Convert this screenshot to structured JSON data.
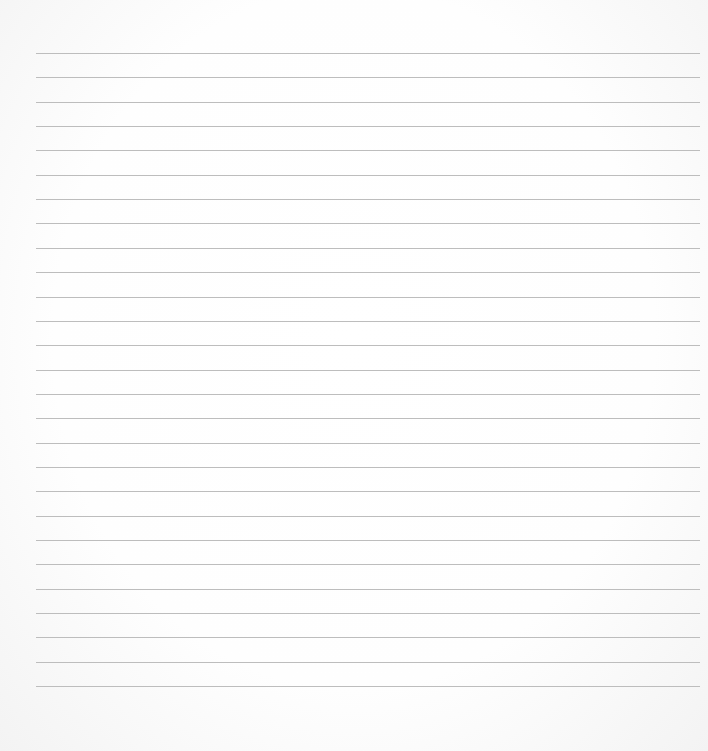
{
  "page": {
    "type": "lined-paper",
    "line_count": 27,
    "line_color": "#bdbdbd",
    "background_color": "#ffffff",
    "first_line_y": 53,
    "line_spacing": 24.35,
    "line_left": 36,
    "line_right": 700
  }
}
